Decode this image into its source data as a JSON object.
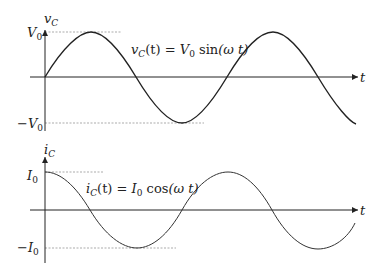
{
  "diagram": {
    "top_plot": {
      "y_axis_label": "v",
      "y_axis_label_sub": "C",
      "x_axis_label": "t",
      "max_tick": "V",
      "max_tick_sub": "0",
      "min_tick": "−V",
      "min_tick_sub": "0",
      "equation": {
        "lhs": "v",
        "lhs_sub": "C",
        "lhs_arg": "(t) = ",
        "amp": "V",
        "amp_sub": "0",
        "func": " sin",
        "arg": "(ω t)"
      },
      "curve": "sine"
    },
    "bottom_plot": {
      "y_axis_label": "i",
      "y_axis_label_sub": "C",
      "x_axis_label": "t",
      "max_tick": "I",
      "max_tick_sub": "0",
      "min_tick": "−I",
      "min_tick_sub": "0",
      "equation": {
        "lhs": "i",
        "lhs_sub": "C",
        "lhs_arg": "(t) = ",
        "amp": "I",
        "amp_sub": "0",
        "func": " cos",
        "arg": "(ω t)"
      },
      "curve": "cosine"
    }
  }
}
